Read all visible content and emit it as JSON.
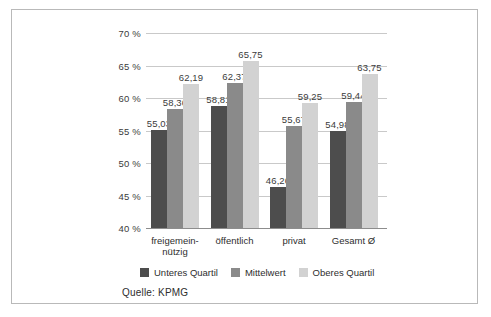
{
  "figure": {
    "source_note": "Quelle: KPMG"
  },
  "chart_data": {
    "type": "bar",
    "title": "",
    "subtitle": "",
    "xlabel": "",
    "ylabel": "",
    "categories": [
      "freigemein-\nnützig",
      "öffentlich",
      "privat",
      "Gesamt Ø"
    ],
    "category_lines": [
      [
        "freigemein-",
        "nützig"
      ],
      [
        "öffentlich"
      ],
      [
        "privat"
      ],
      [
        "Gesamt Ø"
      ]
    ],
    "series": [
      {
        "name": "Unteres Quartil",
        "color": "#4d4d4d",
        "values": [
          55.03,
          58.81,
          46.26,
          54.98
        ],
        "labels": [
          "55,03",
          "58,81",
          "46,26",
          "54,98"
        ]
      },
      {
        "name": "Mittelwert",
        "color": "#8a8a8a",
        "values": [
          58.36,
          62.37,
          55.67,
          59.44
        ],
        "labels": [
          "58,36",
          "62,37",
          "55,67",
          "59,44"
        ]
      },
      {
        "name": "Oberes Quartil",
        "color": "#d2d2d2",
        "values": [
          62.19,
          65.75,
          59.25,
          63.75
        ],
        "labels": [
          "62,19",
          "65,75",
          "59,25",
          "63,75"
        ]
      }
    ],
    "ylim": [
      40,
      70
    ],
    "ytick_values": [
      70,
      65,
      60,
      55,
      50,
      45,
      40
    ],
    "ytick_labels": [
      "70 %",
      "65 %",
      "60 %",
      "55 %",
      "50 %",
      "45 %",
      "40 %"
    ],
    "grid": true,
    "legend_position": "bottom",
    "legend": [
      "Unteres Quartil",
      "Mittelwert",
      "Oberes Quartil"
    ]
  }
}
